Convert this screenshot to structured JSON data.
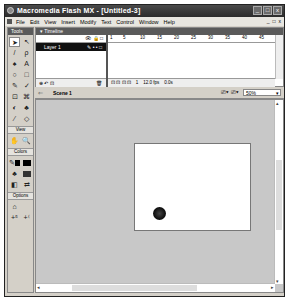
{
  "window": {
    "title": "Macromedia Flash MX - [Untitled-3]",
    "controls": [
      "minimize",
      "maximize",
      "close"
    ]
  },
  "menubar": {
    "items": [
      "File",
      "Edit",
      "View",
      "Insert",
      "Modify",
      "Text",
      "Control",
      "Window",
      "Help"
    ],
    "doc_controls": [
      "_",
      "□",
      "x"
    ]
  },
  "tools": {
    "title": "Tools",
    "items": [
      {
        "name": "arrow",
        "glyph": "➤"
      },
      {
        "name": "subselect",
        "glyph": "↖"
      },
      {
        "name": "line",
        "glyph": "/"
      },
      {
        "name": "lasso",
        "glyph": "ρ"
      },
      {
        "name": "pen",
        "glyph": "♠"
      },
      {
        "name": "text",
        "glyph": "A"
      },
      {
        "name": "oval",
        "glyph": "○"
      },
      {
        "name": "rectangle",
        "glyph": "□"
      },
      {
        "name": "pencil",
        "glyph": "✎"
      },
      {
        "name": "brush",
        "glyph": "✓"
      },
      {
        "name": "free-transform",
        "glyph": "⊡"
      },
      {
        "name": "fill-transform",
        "glyph": "⌘"
      },
      {
        "name": "ink-bottle",
        "glyph": "◐"
      },
      {
        "name": "paint-bucket",
        "glyph": "♣"
      },
      {
        "name": "eyedropper",
        "glyph": "⁄"
      },
      {
        "name": "eraser",
        "glyph": "◇"
      }
    ],
    "view_label": "View",
    "view_items": [
      {
        "name": "hand",
        "glyph": "✋"
      },
      {
        "name": "zoom",
        "glyph": "🔍"
      }
    ],
    "colors_label": "Colors",
    "stroke_color": "#000000",
    "fill_color": "#000000",
    "options_label": "Options",
    "option_items": [
      "⌂",
      "+⁵",
      "+⁽"
    ]
  },
  "timeline": {
    "title": "▾ Timeline",
    "header_icons": "👁 🔒 □",
    "layer_name": "Layer 1",
    "layer_controls": "✎ • • □",
    "ruler_ticks": [
      "1",
      "5",
      "10",
      "15",
      "20",
      "25",
      "30",
      "35",
      "40",
      "45"
    ],
    "footer_left": "⊕ ↶ ⊡",
    "footer_trash": "🗑",
    "current_frame": "1",
    "fps": "12.0 fps",
    "elapsed": "0.0s"
  },
  "scene": {
    "label": "Scene 1",
    "zoom": "50%"
  },
  "stage": {
    "background": "#ffffff",
    "objects": [
      {
        "type": "circle",
        "color": "#111111"
      }
    ]
  }
}
